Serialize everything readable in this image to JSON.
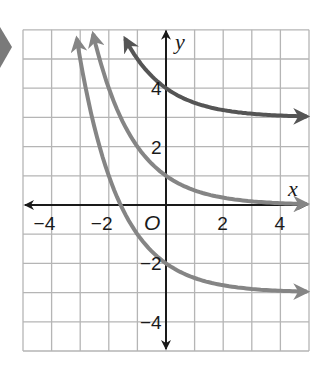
{
  "marker": {
    "color": "#7a7a7a"
  },
  "colors": {
    "grid": "#b5b5b5",
    "axis": "#1a1a1a",
    "curve_dark": "#555555",
    "curve_light": "#858585"
  },
  "chart_data": {
    "type": "line",
    "title": "",
    "xlabel": "x",
    "ylabel": "y",
    "origin_label": "O",
    "xlim": [
      -5,
      5
    ],
    "ylim": [
      -5,
      6
    ],
    "grid": true,
    "x_ticks": [
      {
        "value": -4,
        "label": "−4"
      },
      {
        "value": -2,
        "label": "−2"
      },
      {
        "value": 2,
        "label": "2"
      },
      {
        "value": 4,
        "label": "4"
      }
    ],
    "y_ticks": [
      {
        "value": 4,
        "label": "4"
      },
      {
        "value": 2,
        "label": "2"
      },
      {
        "value": -2,
        "label": "−2"
      },
      {
        "value": -4,
        "label": "−4"
      }
    ],
    "series": [
      {
        "name": "y = (1/2)^x + 3",
        "base": 0.5,
        "shift": 3,
        "x_start": -1.43,
        "x_end": 5,
        "y_intercept": 4,
        "asymptote": 3,
        "color_key": "curve_dark"
      },
      {
        "name": "y = (1/2)^x",
        "base": 0.5,
        "shift": 0,
        "x_start": -2.55,
        "x_end": 5,
        "y_intercept": 1,
        "asymptote": 0,
        "color_key": "curve_light"
      },
      {
        "name": "y = (1/2)^x - 3",
        "base": 0.5,
        "shift": -3,
        "x_start": -3.12,
        "x_end": 5,
        "y_intercept": -2,
        "asymptote": -3,
        "color_key": "curve_light"
      }
    ]
  }
}
